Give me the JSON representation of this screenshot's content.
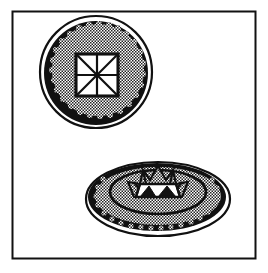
{
  "illustration": {
    "description": "Line-art illustration of two decorated discs inside a square frame",
    "colors": {
      "ink": "#111111",
      "paper": "#ffffff",
      "stipple": "#9a9a9a"
    },
    "frame": {
      "x": 12,
      "y": 11,
      "width": 243,
      "height": 247
    },
    "top_disc": {
      "label": "round disc with square cross motif",
      "center": [
        96,
        72
      ],
      "outer_radius": 56,
      "motif": "square divided by cross and diagonals into 8 triangles",
      "square": {
        "x": 76,
        "y": 54,
        "size": 42
      }
    },
    "bottom_disc": {
      "label": "oval disc with crown motif",
      "center": [
        158,
        198
      ],
      "rx": 72,
      "ry": 37,
      "inner_ring": {
        "rx": 48,
        "ry": 22
      },
      "motif": "zigzag crown with white triangular teeth"
    }
  }
}
